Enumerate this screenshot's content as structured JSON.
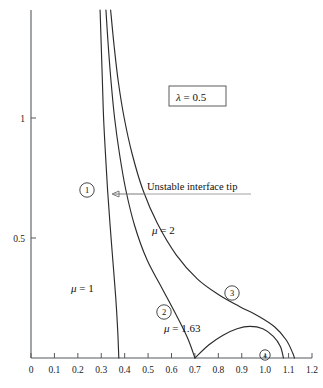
{
  "chart_data": {
    "type": "line",
    "title": "",
    "subtitle": "",
    "xlabel": "",
    "ylabel": "",
    "xlim": [
      0,
      1.2
    ],
    "ylim": [
      0,
      1.45
    ],
    "grid": false,
    "legend_position": "inline-annotations",
    "x_ticks": [
      "0",
      "0.1",
      "0.2",
      "0.3",
      "0.4",
      "0.5",
      "0.6",
      "0.7",
      "0.8",
      "0.9",
      "1.0",
      "1.1",
      "1.2"
    ],
    "x_tick_values": [
      0,
      0.1,
      0.2,
      0.3,
      0.4,
      0.5,
      0.6,
      0.7,
      0.8,
      0.9,
      1.0,
      1.1,
      1.2
    ],
    "y_ticks": [
      "0.5",
      "1"
    ],
    "y_tick_values": [
      0.5,
      1.0
    ],
    "series": [
      {
        "name": "mu = 1",
        "label": "μ = 1",
        "mu": 1,
        "region": "1",
        "points": [
          [
            0.295,
            1.45
          ],
          [
            0.3,
            1.3
          ],
          [
            0.305,
            1.15
          ],
          [
            0.31,
            1.0
          ],
          [
            0.318,
            0.85
          ],
          [
            0.327,
            0.7
          ],
          [
            0.338,
            0.55
          ],
          [
            0.35,
            0.4
          ],
          [
            0.362,
            0.25
          ],
          [
            0.37,
            0.12
          ],
          [
            0.375,
            0.0
          ]
        ]
      },
      {
        "name": "mu = 1.63",
        "label": "μ = 1.63",
        "mu": 1.63,
        "region": "2",
        "points": [
          [
            0.32,
            1.45
          ],
          [
            0.33,
            1.3
          ],
          [
            0.342,
            1.15
          ],
          [
            0.357,
            1.0
          ],
          [
            0.378,
            0.85
          ],
          [
            0.405,
            0.7
          ],
          [
            0.443,
            0.55
          ],
          [
            0.495,
            0.41
          ],
          [
            0.56,
            0.29
          ],
          [
            0.625,
            0.17
          ],
          [
            0.67,
            0.08
          ],
          [
            0.7,
            0.0
          ]
        ]
      },
      {
        "name": "mu = 1.63 lobe",
        "label": "",
        "mu": 1.63,
        "region": "2-lobe",
        "points": [
          [
            0.7,
            0.0
          ],
          [
            0.76,
            0.055
          ],
          [
            0.82,
            0.095
          ],
          [
            0.88,
            0.122
          ],
          [
            0.935,
            0.132
          ],
          [
            0.99,
            0.122
          ],
          [
            1.035,
            0.09
          ],
          [
            1.065,
            0.048
          ],
          [
            1.078,
            0.0
          ]
        ]
      },
      {
        "name": "mu = 2",
        "label": "μ = 2",
        "mu": 2,
        "region": "3",
        "points": [
          [
            0.34,
            1.45
          ],
          [
            0.355,
            1.3
          ],
          [
            0.373,
            1.15
          ],
          [
            0.398,
            1.0
          ],
          [
            0.432,
            0.85
          ],
          [
            0.478,
            0.7
          ],
          [
            0.54,
            0.56
          ],
          [
            0.62,
            0.43
          ],
          [
            0.71,
            0.33
          ],
          [
            0.8,
            0.265
          ],
          [
            0.89,
            0.215
          ],
          [
            0.97,
            0.175
          ],
          [
            1.04,
            0.13
          ],
          [
            1.09,
            0.075
          ],
          [
            1.118,
            0.02
          ],
          [
            1.125,
            0.0
          ]
        ]
      }
    ],
    "annotations": [
      {
        "name": "lambda-box",
        "text": "λ = 0.5",
        "x": 0.68,
        "y": 1.13,
        "boxed": true
      },
      {
        "name": "unstable-tip-label",
        "text": "Unstable interface tip",
        "x": 0.54,
        "y": 0.7,
        "arrow_to_x": 0.345,
        "arrow_to_y": 0.695
      },
      {
        "name": "mu1-label",
        "text": "μ = 1",
        "x": 0.26,
        "y": 0.305
      },
      {
        "name": "mu2-label",
        "text": "μ = 2",
        "x": 0.6,
        "y": 0.545
      },
      {
        "name": "mu163-label",
        "text": "μ = 1.63",
        "x": 0.655,
        "y": 0.195
      },
      {
        "name": "region-1-marker",
        "text": "1",
        "x": 0.24,
        "y": 0.725,
        "circled": true
      },
      {
        "name": "region-2-marker",
        "text": "2",
        "x": 0.565,
        "y": 0.225,
        "circled": true
      },
      {
        "name": "region-3-marker",
        "text": "3",
        "x": 0.855,
        "y": 0.305,
        "circled": true
      },
      {
        "name": "region-4-marker",
        "text": "4",
        "x": 1.0,
        "y": 0.015,
        "circled": true
      }
    ]
  },
  "axes": {
    "x_tick_labels": [
      "0",
      "0.1",
      "0.2",
      "0.3",
      "0.4",
      "0.5",
      "0.6",
      "0.7",
      "0.8",
      "0.9",
      "1.0",
      "1.1",
      "1.2"
    ],
    "y_tick_labels": [
      "0.5",
      "1"
    ]
  },
  "labels": {
    "lambda_box": "λ = 0.5",
    "unstable_tip": "Unstable interface tip",
    "mu_1": "μ = 1",
    "mu_2": "μ = 2",
    "mu_163": "μ = 1.63",
    "circle_1": "1",
    "circle_2": "2",
    "circle_3": "3",
    "circle_4": "4"
  },
  "colors": {
    "curve": "#2b2b2b",
    "axis": "#555a5e",
    "text": "#111111",
    "background": "#ffffff"
  }
}
